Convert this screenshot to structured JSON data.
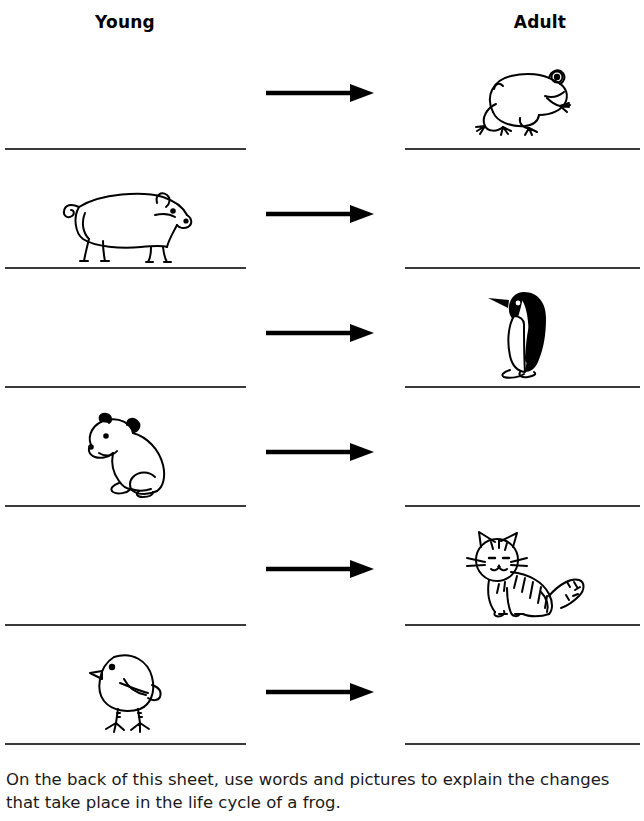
{
  "worksheet": {
    "columns": {
      "young_label": "Young",
      "adult_label": "Adult"
    },
    "rows": [
      {
        "index": 1,
        "young": {
          "animal": "",
          "filled": false,
          "icon": "blank"
        },
        "arrow": "arrow-right",
        "adult": {
          "animal": "frog",
          "filled": true,
          "icon": "frog-drawing"
        }
      },
      {
        "index": 2,
        "young": {
          "animal": "piglet",
          "filled": true,
          "icon": "piglet-drawing"
        },
        "arrow": "arrow-right",
        "adult": {
          "animal": "",
          "filled": false,
          "icon": "blank"
        }
      },
      {
        "index": 3,
        "young": {
          "animal": "",
          "filled": false,
          "icon": "blank"
        },
        "arrow": "arrow-right",
        "adult": {
          "animal": "penguin",
          "filled": true,
          "icon": "penguin-drawing"
        }
      },
      {
        "index": 4,
        "young": {
          "animal": "bear cub",
          "filled": true,
          "icon": "bear-cub-drawing"
        },
        "arrow": "arrow-right",
        "adult": {
          "animal": "",
          "filled": false,
          "icon": "blank"
        }
      },
      {
        "index": 5,
        "young": {
          "animal": "",
          "filled": false,
          "icon": "blank"
        },
        "arrow": "arrow-right",
        "adult": {
          "animal": "cat",
          "filled": true,
          "icon": "cat-drawing"
        }
      },
      {
        "index": 6,
        "young": {
          "animal": "chick",
          "filled": true,
          "icon": "chick-drawing"
        },
        "arrow": "arrow-right",
        "adult": {
          "animal": "",
          "filled": false,
          "icon": "blank"
        }
      }
    ],
    "instruction": {
      "line1": "On the back of this sheet, use words and pictures to explain the changes",
      "line2": "that take place in the life cycle of a frog."
    },
    "colors": {
      "ink": "#000000",
      "rule_line": "#3a3a3a",
      "page_background": "#ffffff"
    }
  }
}
